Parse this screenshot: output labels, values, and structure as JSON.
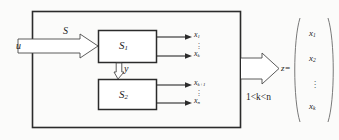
{
  "figure": {
    "type": "block-diagram",
    "background_color": "#fbfbfa",
    "line_color": "#2b2b2b"
  },
  "outer_frame": {
    "name": "system-boundary"
  },
  "input": {
    "signal_label": "u",
    "arrow_label": "S"
  },
  "blocks": [
    {
      "id": "s1",
      "label": "S",
      "subscript": "1",
      "outputs": [
        {
          "label": "x",
          "subscript": "1"
        },
        {
          "label": "x",
          "subscript": "k"
        }
      ]
    },
    {
      "id": "s2",
      "label": "S",
      "subscript": "2",
      "outputs": [
        {
          "label": "x",
          "subscript": "k+1"
        },
        {
          "label": "x",
          "subscript": "n"
        }
      ]
    }
  ],
  "feedback": {
    "label": "y"
  },
  "output": {
    "label": "z",
    "equals": "=",
    "condition": "1<k<n"
  },
  "vector": {
    "open_bracket": "(",
    "close_bracket": ")",
    "entries": [
      {
        "label": "x",
        "subscript": "1"
      },
      {
        "label": "x",
        "subscript": "2"
      },
      {
        "label": "x",
        "subscript": "k"
      }
    ],
    "ellipsis": "vertical-dots"
  },
  "dots": {
    "glyph": "."
  }
}
